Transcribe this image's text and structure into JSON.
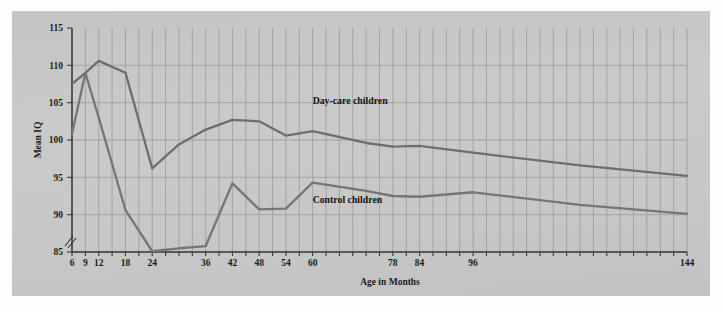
{
  "figure": {
    "background_color": "#fdfdfd",
    "panel_color": "#c9c9c9",
    "line_color": "#6e6e6e",
    "grid_color": "#9a9a9a",
    "axis_color": "#3a3a3a"
  },
  "chart_data": {
    "type": "line",
    "title": "",
    "xlabel": "Age in Months",
    "ylabel": "Mean IQ",
    "xlim": [
      6,
      144
    ],
    "ylim": [
      85,
      115
    ],
    "y_axis_break": true,
    "grid": true,
    "legend_position": "inline-annotation",
    "x_tick_labels": [
      "6",
      "9",
      "12",
      "18",
      "24",
      "36",
      "42",
      "48",
      "54",
      "60",
      "78",
      "84",
      "96",
      "144"
    ],
    "x_tick_values": [
      6,
      9,
      12,
      18,
      24,
      36,
      42,
      48,
      54,
      60,
      78,
      84,
      96,
      144
    ],
    "y_tick_labels": [
      "85",
      "90",
      "95",
      "100",
      "105",
      "110",
      "115"
    ],
    "y_tick_values": [
      85,
      90,
      95,
      100,
      105,
      110,
      115
    ],
    "x": [
      6,
      9,
      12,
      18,
      24,
      30,
      36,
      42,
      48,
      54,
      60,
      72,
      78,
      84,
      96,
      120,
      144
    ],
    "series": [
      {
        "name": "Day-care children",
        "label": "Day-care children",
        "color": "#6e6e6e",
        "values": [
          107.5,
          109.0,
          110.6,
          109.0,
          96.2,
          99.4,
          101.4,
          102.7,
          102.5,
          100.6,
          101.2,
          99.6,
          99.1,
          99.2,
          98.3,
          96.6,
          95.2
        ]
      },
      {
        "name": "Control children",
        "label": "Control children",
        "color": "#767676",
        "values": [
          100.8,
          109.0,
          103.0,
          90.6,
          85.1,
          85.5,
          85.8,
          94.2,
          90.7,
          90.8,
          94.3,
          93.2,
          92.5,
          92.4,
          93.0,
          91.3,
          90.1
        ]
      }
    ],
    "annotations": [
      {
        "text": "Day-care children",
        "x": 60,
        "y": 104.8
      },
      {
        "text": "Control children",
        "x": 60,
        "y": 91.6
      }
    ]
  }
}
